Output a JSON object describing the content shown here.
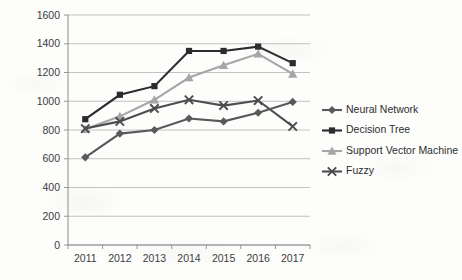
{
  "chart_data": {
    "type": "line",
    "title": "",
    "subtitle": "",
    "xlabel": "",
    "ylabel": "",
    "categories": [
      "2011",
      "2012",
      "2013",
      "2014",
      "2015",
      "2016",
      "2017"
    ],
    "x": [
      2011,
      2012,
      2013,
      2014,
      2015,
      2016,
      2017
    ],
    "ylim": [
      0,
      1600
    ],
    "yticks": [
      0,
      200,
      400,
      600,
      800,
      1000,
      1200,
      1400,
      1600
    ],
    "ytick_labels": [
      "0",
      "200",
      "400",
      "600",
      "800",
      "1000",
      "1200",
      "1400",
      "1600"
    ],
    "grid": "horizontal",
    "legend_position": "right",
    "series": [
      {
        "name": "Neural Network",
        "marker": "diamond",
        "color": "#595959",
        "values": [
          610,
          775,
          800,
          880,
          860,
          920,
          995
        ]
      },
      {
        "name": "Decision Tree",
        "marker": "square",
        "color": "#2b2b2b",
        "values": [
          875,
          1045,
          1105,
          1350,
          1350,
          1380,
          1265
        ]
      },
      {
        "name": "Support Vector Machine",
        "marker": "triangle",
        "color": "#a6a6a6",
        "values": [
          805,
          895,
          1010,
          1165,
          1250,
          1330,
          1190
        ]
      },
      {
        "name": "Fuzzy",
        "marker": "x",
        "color": "#4d4d4d",
        "values": [
          810,
          860,
          950,
          1010,
          970,
          1005,
          825
        ]
      }
    ]
  },
  "legend": {
    "items": [
      {
        "label": "Neural Network",
        "marker": "diamond-marker-icon"
      },
      {
        "label": "Decision Tree",
        "marker": "square-marker-icon"
      },
      {
        "label": "Support Vector Machine",
        "marker": "triangle-marker-icon"
      },
      {
        "label": "Fuzzy",
        "marker": "x-marker-icon"
      }
    ]
  },
  "colors": {
    "background": "#fdfdfc",
    "gridline": "#b3b3b3",
    "axis": "#8a8a8a",
    "text": "#3b3b3b"
  }
}
